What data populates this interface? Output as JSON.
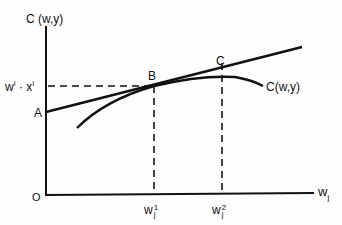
{
  "diagram": {
    "y_axis_label": "C (w,y)",
    "x_axis_label": {
      "base": "w",
      "sub": "j"
    },
    "origin_label": "O",
    "intercept_label": "A",
    "level_label": {
      "w": "w",
      "w_sup": "I",
      "dot": "·",
      "x": "x",
      "x_sup": "I"
    },
    "point_b_label": "B",
    "point_c_label": "C",
    "curve_label": "C(w,y)",
    "tick_w1": {
      "base": "w",
      "sup": "1",
      "sub": "j"
    },
    "tick_w2": {
      "base": "w",
      "sup": "2",
      "sub": "j"
    },
    "colors": {
      "ink": "#111111",
      "background": "#fdfdfd"
    }
  }
}
